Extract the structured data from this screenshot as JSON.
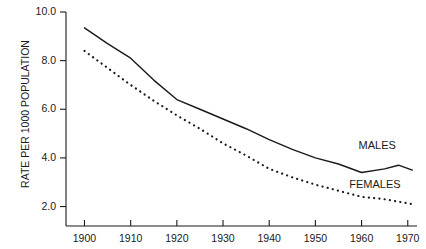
{
  "chart_data": {
    "type": "line",
    "title": "",
    "xlabel": "",
    "ylabel": "RATE PER 1000 POPULATION",
    "xlim": [
      1896,
      1972
    ],
    "ylim": [
      1.2,
      10.0
    ],
    "grid": false,
    "legend_position": "inline-right",
    "x_ticks": [
      1900,
      1910,
      1920,
      1930,
      1940,
      1950,
      1960,
      1970
    ],
    "x_tick_labels": [
      "1900",
      "1910",
      "1920",
      "1930",
      "1940",
      "1950",
      "1960",
      "1970"
    ],
    "y_ticks": [
      2.0,
      4.0,
      6.0,
      8.0,
      10.0
    ],
    "y_tick_labels": [
      "2.0",
      "4.0",
      "6.0",
      "8.0",
      "10.0"
    ],
    "series": [
      {
        "name": "MALES",
        "style": "solid",
        "color": "#1a1a1a",
        "x": [
          1900,
          1905,
          1910,
          1915,
          1920,
          1925,
          1930,
          1935,
          1940,
          1945,
          1950,
          1955,
          1960,
          1965,
          1968,
          1971
        ],
        "values": [
          9.35,
          8.7,
          8.1,
          7.2,
          6.4,
          6.0,
          5.6,
          5.2,
          4.75,
          4.35,
          4.0,
          3.75,
          3.4,
          3.55,
          3.7,
          3.5
        ]
      },
      {
        "name": "FEMALES",
        "style": "dotted",
        "color": "#1a1a1a",
        "x": [
          1900,
          1905,
          1910,
          1915,
          1920,
          1925,
          1930,
          1935,
          1940,
          1945,
          1950,
          1955,
          1960,
          1965,
          1968,
          1971
        ],
        "values": [
          8.4,
          7.7,
          7.0,
          6.35,
          5.75,
          5.2,
          4.6,
          4.1,
          3.55,
          3.2,
          2.9,
          2.65,
          2.4,
          2.3,
          2.2,
          2.1
        ]
      }
    ],
    "annotations": [
      {
        "text": "MALES",
        "x": 1968,
        "y": 4.5
      },
      {
        "text": "FEMALES",
        "x": 1966,
        "y": 2.9
      }
    ],
    "axis_color": "#1a1a1a"
  }
}
